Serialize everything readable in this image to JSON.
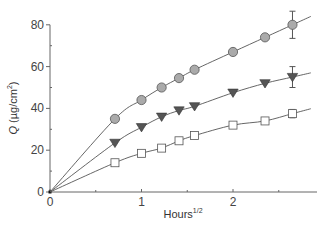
{
  "chart_data": {
    "type": "scatter",
    "title": "",
    "xlabel": "Hours",
    "xlabel_superscript": "1/2",
    "ylabel": "Q (µg/cm²)",
    "ylabel_italic_part": "Q",
    "ylabel_unit": "(µg/cm",
    "ylabel_unit_sup": "2",
    "ylabel_unit_close": ")",
    "xlim": [
      0,
      2.9
    ],
    "ylim": [
      0,
      80
    ],
    "x_ticks": [
      0,
      1,
      2
    ],
    "x_tick_labels": [
      "0",
      "1",
      "2"
    ],
    "x_minor_ticks": [
      0.5,
      1.5,
      2.5
    ],
    "y_ticks": [
      0,
      20,
      40,
      60,
      80
    ],
    "y_tick_labels": [
      "0",
      "20",
      "40",
      "60",
      "80"
    ],
    "y_minor_ticks": [
      10,
      30,
      50,
      70
    ],
    "grid": false,
    "legend": null,
    "x": [
      0.71,
      1.0,
      1.22,
      1.41,
      1.58,
      2.0,
      2.35,
      2.65
    ],
    "series": [
      {
        "name": "circles",
        "marker": "circle",
        "fill": "#aaaaaa",
        "values": [
          35,
          44,
          50,
          54.5,
          58.5,
          67,
          74,
          80
        ],
        "error_last": 6.5,
        "fit_line": true
      },
      {
        "name": "triangles",
        "marker": "triangle-down",
        "fill": "#555555",
        "values": [
          23.5,
          31,
          36,
          39,
          41,
          47.5,
          52,
          55
        ],
        "error_last": 5,
        "fit_line": true
      },
      {
        "name": "squares",
        "marker": "square",
        "fill": "#ffffff",
        "values": [
          14,
          18.5,
          21,
          24.5,
          27,
          32,
          34,
          37.5
        ],
        "error_last": 2,
        "fit_line": true
      }
    ]
  }
}
